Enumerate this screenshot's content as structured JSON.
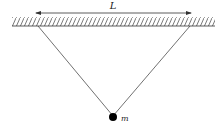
{
  "diagram": {
    "length_label": "L",
    "mass_label": "m",
    "colors": {
      "line": "#333333",
      "mass": "#000000"
    }
  }
}
